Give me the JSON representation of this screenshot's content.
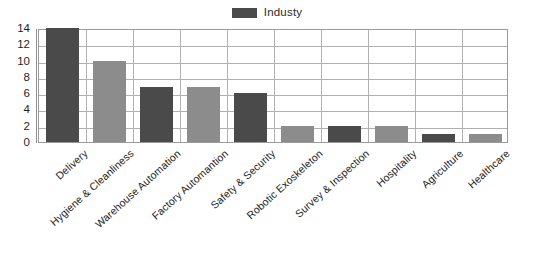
{
  "chart_data": {
    "type": "bar",
    "title": "",
    "subtitle": "",
    "xlabel": "",
    "ylabel": "",
    "ylim": [
      0,
      14
    ],
    "ytick_step": 2,
    "yticks": [
      14,
      12,
      10,
      8,
      6,
      4,
      2,
      0
    ],
    "grid": true,
    "legend_position": "top-center",
    "categories": [
      "Delivery",
      "Hygiene & Cleanliness",
      "Warehouse Automation",
      "Factory Automantion",
      "Safety & Security",
      "Robotic Exoskeleton",
      "Survey & Inspection",
      "Hospitality",
      "Agriculture",
      "Healthcare"
    ],
    "series": [
      {
        "name": "Industy",
        "values": [
          14,
          10,
          6.8,
          6.8,
          6,
          2,
          2,
          2,
          1,
          1
        ]
      }
    ],
    "bar_colors": [
      "#4a4a4a",
      "#8c8c8c",
      "#4a4a4a",
      "#8c8c8c",
      "#4a4a4a",
      "#8c8c8c",
      "#4a4a4a",
      "#8c8c8c",
      "#4a4a4a",
      "#8c8c8c"
    ]
  },
  "legend": {
    "entries": [
      {
        "label": "Industy",
        "color": "#4a4a4a"
      }
    ]
  },
  "colors": {
    "dark_bar": "#4a4a4a",
    "light_bar": "#8c8c8c",
    "grid": "#b0b0b0",
    "frame": "#9a9a9a",
    "axis": "#8f8f8f",
    "text": "#1a1a1a",
    "background": "#ffffff"
  }
}
